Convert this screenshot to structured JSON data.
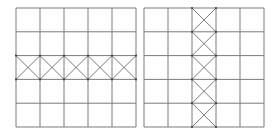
{
  "figure": {
    "background": "#ffffff",
    "line_color": "#7a7a7a",
    "dot_color": "#444444",
    "panels": [
      {
        "id": "left",
        "description": "5x5 grid with diagonal cross-bracing in the middle row",
        "x": 16,
        "y": 8,
        "width": 120,
        "height": 119,
        "rows": 5,
        "cols": 5,
        "braced": {
          "type": "row",
          "index": 2
        }
      },
      {
        "id": "right",
        "description": "5x5 grid with diagonal cross-bracing in the middle column",
        "x": 144,
        "y": 8,
        "width": 120,
        "height": 119,
        "rows": 5,
        "cols": 5,
        "braced": {
          "type": "col",
          "index": 2
        }
      }
    ]
  }
}
